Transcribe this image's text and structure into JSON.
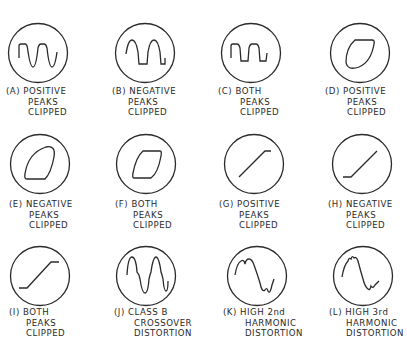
{
  "figure": {
    "items": [
      {
        "tag": "(A)",
        "lines": [
          "POSITIVE",
          "PEAKS",
          "CLIPPED"
        ],
        "trace": "sine-positive-peaks-clipped"
      },
      {
        "tag": "(B)",
        "lines": [
          "NEGATIVE",
          "PEAKS",
          "CLIPPED"
        ],
        "trace": "sine-negative-peaks-clipped"
      },
      {
        "tag": "(C)",
        "lines": [
          "BOTH",
          "PEAKS",
          "CLIPPED"
        ],
        "trace": "sine-both-peaks-clipped"
      },
      {
        "tag": "(D)",
        "lines": [
          "POSITIVE",
          "PEAKS",
          "CLIPPED"
        ],
        "trace": "ellipse-positive-clipped"
      },
      {
        "tag": "(E)",
        "lines": [
          "NEGATIVE",
          "PEAKS",
          "CLIPPED"
        ],
        "trace": "ellipse-negative-clipped"
      },
      {
        "tag": "(F)",
        "lines": [
          "BOTH",
          "PEAKS",
          "CLIPPED"
        ],
        "trace": "ellipse-both-clipped"
      },
      {
        "tag": "(G)",
        "lines": [
          "POSITIVE",
          "PEAKS",
          "CLIPPED"
        ],
        "trace": "line-positive-clipped"
      },
      {
        "tag": "(H)",
        "lines": [
          "NEGATIVE",
          "PEAKS",
          "CLIPPED"
        ],
        "trace": "line-negative-clipped"
      },
      {
        "tag": "(I)",
        "lines": [
          "BOTH",
          "PEAKS",
          "CLIPPED"
        ],
        "trace": "line-both-clipped"
      },
      {
        "tag": "(J)",
        "lines": [
          "CLASS B",
          "CROSSOVER",
          "DISTORTION"
        ],
        "trace": "crossover-distortion"
      },
      {
        "tag": "(K)",
        "lines": [
          "HIGH 2nd",
          "HARMONIC",
          "DISTORTION"
        ],
        "trace": "second-harmonic"
      },
      {
        "tag": "(L)",
        "lines": [
          "HIGH 3rd",
          "HARMONIC",
          "DISTORTION"
        ],
        "trace": "third-harmonic"
      }
    ]
  },
  "colors": {
    "ink": "#2a2a2a",
    "background": "#ffffff"
  }
}
